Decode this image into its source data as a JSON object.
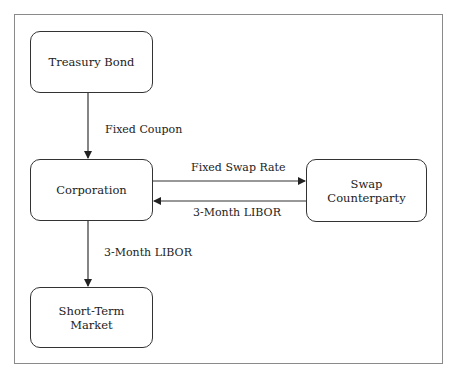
{
  "diagram": {
    "nodes": [
      {
        "id": "treasury-bond",
        "label": "Treasury Bond"
      },
      {
        "id": "corporation",
        "label": "Corporation"
      },
      {
        "id": "swap-counterparty",
        "label": "Swap\nCounterparty"
      },
      {
        "id": "short-term-market",
        "label": "Short-Term\nMarket"
      }
    ],
    "edges": [
      {
        "from": "treasury-bond",
        "to": "corporation",
        "label": "Fixed Coupon"
      },
      {
        "from": "corporation",
        "to": "swap-counterparty",
        "label": "Fixed Swap Rate"
      },
      {
        "from": "swap-counterparty",
        "to": "corporation",
        "label": "3-Month LIBOR"
      },
      {
        "from": "corporation",
        "to": "short-term-market",
        "label": "3-Month LIBOR"
      }
    ]
  }
}
